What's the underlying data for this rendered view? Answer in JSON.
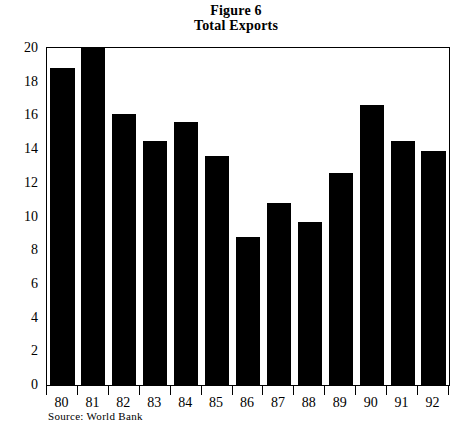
{
  "title": {
    "line1": "Figure 6",
    "line2": "Total Exports"
  },
  "source": "Source: World Bank",
  "chart_data": {
    "type": "bar",
    "subtitle": "Total Exports",
    "xlabel": "",
    "ylabel": "",
    "categories": [
      "80",
      "81",
      "82",
      "83",
      "84",
      "85",
      "86",
      "87",
      "88",
      "89",
      "90",
      "91",
      "92"
    ],
    "values": [
      18.8,
      20.0,
      16.1,
      14.5,
      15.6,
      13.6,
      8.8,
      10.8,
      9.7,
      12.6,
      16.6,
      14.5,
      13.9
    ],
    "series": [
      {
        "name": "Total Exports",
        "values": [
          18.8,
          20.0,
          16.1,
          14.5,
          15.6,
          13.6,
          8.8,
          10.8,
          9.7,
          12.6,
          16.6,
          14.5,
          13.9
        ]
      }
    ],
    "ylim": [
      0,
      20
    ],
    "xlim": [
      0,
      13
    ],
    "yticks": [
      0,
      2,
      4,
      6,
      8,
      10,
      12,
      14,
      16,
      18,
      20
    ],
    "ytick_labels": [
      "0",
      "2",
      "4",
      "6",
      "8",
      "10",
      "12",
      "14",
      "16",
      "18",
      "20"
    ],
    "grid": false,
    "legend": false,
    "legend_position": "none",
    "bar_color": "#000000",
    "frame_color": "#000000",
    "background_color": "#ffffff",
    "annotations": [
      "Source: World Bank"
    ]
  }
}
